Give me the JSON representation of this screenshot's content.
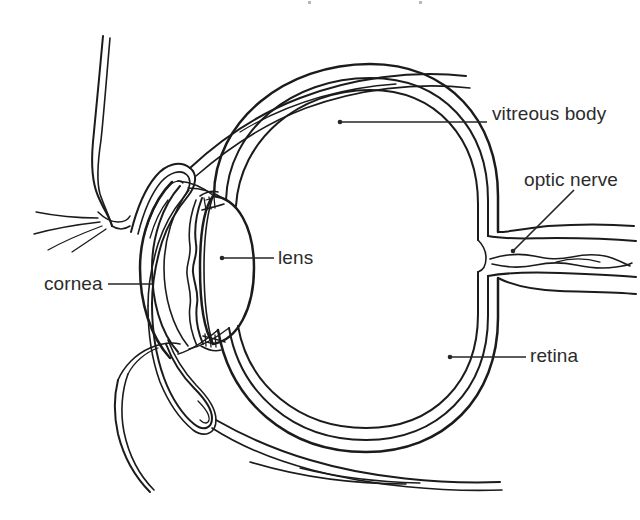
{
  "figure": {
    "type": "line-drawing",
    "background_color": "#ffffff",
    "ink_color": "#1b1b1b",
    "label_color": "#2b2b2b",
    "width": 640,
    "height": 520
  },
  "labels": [
    {
      "id": "vitreous-body",
      "text": "vitreous body",
      "leader": {
        "from_x": 340,
        "from_y": 122,
        "to_x": 487,
        "to_y": 122,
        "style": "straight",
        "has_dot": true
      }
    },
    {
      "id": "optic-nerve",
      "text": "optic nerve",
      "leader": {
        "from_x": 513,
        "from_y": 251,
        "to_x": 572,
        "to_y": 192,
        "style": "diagonal",
        "has_dot": true
      }
    },
    {
      "id": "lens",
      "text": "lens",
      "leader": {
        "from_x": 222,
        "from_y": 258,
        "to_x": 274,
        "to_y": 258,
        "style": "straight",
        "has_dot": true
      }
    },
    {
      "id": "cornea",
      "text": "cornea",
      "leader": {
        "from_x": 152,
        "from_y": 284,
        "to_x": 108,
        "to_y": 284,
        "style": "straight",
        "has_dot": false
      }
    },
    {
      "id": "retina",
      "text": "retina",
      "leader": {
        "from_x": 450,
        "from_y": 357,
        "to_x": 526,
        "to_y": 357,
        "style": "straight",
        "has_dot": true
      }
    }
  ],
  "structures": [
    "upper eyelid",
    "lower eyelid",
    "eyelashes",
    "conjunctival fornix",
    "cornea",
    "anterior chamber",
    "iris",
    "ciliary body",
    "lens",
    "sclera",
    "choroid",
    "retina",
    "vitreous body",
    "optic nerve",
    "central retinal vessel"
  ]
}
